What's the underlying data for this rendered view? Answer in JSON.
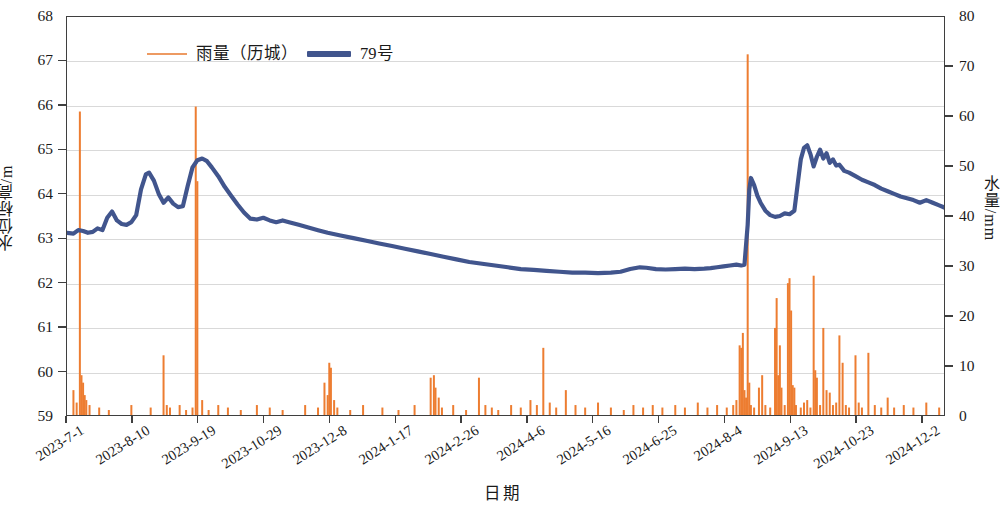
{
  "legend": {
    "position": "top-left",
    "items": [
      {
        "label": "雨量（历城）",
        "color": "#ed9a62",
        "style": "thin-line"
      },
      {
        "label": "79号",
        "color": "#41558d",
        "style": "thick-line"
      }
    ]
  },
  "axes": {
    "y_left_label": "水位标高/m",
    "y_right_label": "水量/mm",
    "x_label": "日期"
  },
  "chart_data": {
    "type": "line",
    "title": "",
    "xlabel": "日期",
    "ylabel": "水位标高/m",
    "y2label": "水量/mm",
    "ylim": [
      59,
      68
    ],
    "y2lim": [
      0,
      80
    ],
    "yticks": [
      59,
      60,
      61,
      62,
      63,
      64,
      65,
      66,
      67,
      68
    ],
    "y2ticks": [
      0,
      10,
      20,
      30,
      40,
      50,
      60,
      70,
      80
    ],
    "grid": "horizontal",
    "x_start": "2023-7-1",
    "x_end": "2024-12-27",
    "xtick_labels": [
      "2023-7-1",
      "2023-8-10",
      "2023-9-19",
      "2023-10-29",
      "2023-12-8",
      "2024-1-17",
      "2024-2-26",
      "2024-4-6",
      "2024-5-16",
      "2024-6-25",
      "2024-8-4",
      "2024-9-13",
      "2024-10-23",
      "2024-12-2"
    ],
    "xtick_interval_days": 40,
    "series": [
      {
        "name": "79号",
        "axis": "left",
        "type": "line",
        "color": "#41558d",
        "unit": "m",
        "points": [
          [
            0,
            63.12
          ],
          [
            4,
            63.1
          ],
          [
            7,
            63.18
          ],
          [
            10,
            63.16
          ],
          [
            13,
            63.12
          ],
          [
            16,
            63.14
          ],
          [
            19,
            63.22
          ],
          [
            22,
            63.18
          ],
          [
            25,
            63.46
          ],
          [
            28,
            63.6
          ],
          [
            31,
            63.4
          ],
          [
            34,
            63.32
          ],
          [
            37,
            63.3
          ],
          [
            40,
            63.36
          ],
          [
            43,
            63.52
          ],
          [
            46,
            64.1
          ],
          [
            49,
            64.44
          ],
          [
            51,
            64.48
          ],
          [
            54,
            64.3
          ],
          [
            57,
            64.0
          ],
          [
            60,
            63.8
          ],
          [
            63,
            63.92
          ],
          [
            66,
            63.78
          ],
          [
            69,
            63.7
          ],
          [
            72,
            63.72
          ],
          [
            75,
            64.18
          ],
          [
            78,
            64.6
          ],
          [
            81,
            64.76
          ],
          [
            84,
            64.8
          ],
          [
            87,
            64.74
          ],
          [
            90,
            64.6
          ],
          [
            94,
            64.4
          ],
          [
            98,
            64.16
          ],
          [
            102,
            63.96
          ],
          [
            106,
            63.76
          ],
          [
            110,
            63.58
          ],
          [
            114,
            63.44
          ],
          [
            118,
            63.42
          ],
          [
            122,
            63.46
          ],
          [
            126,
            63.4
          ],
          [
            130,
            63.36
          ],
          [
            134,
            63.4
          ],
          [
            138,
            63.36
          ],
          [
            144,
            63.3
          ],
          [
            150,
            63.24
          ],
          [
            156,
            63.18
          ],
          [
            162,
            63.12
          ],
          [
            170,
            63.06
          ],
          [
            178,
            63.0
          ],
          [
            186,
            62.94
          ],
          [
            194,
            62.88
          ],
          [
            202,
            62.82
          ],
          [
            210,
            62.76
          ],
          [
            218,
            62.7
          ],
          [
            226,
            62.64
          ],
          [
            234,
            62.58
          ],
          [
            242,
            62.52
          ],
          [
            250,
            62.46
          ],
          [
            258,
            62.42
          ],
          [
            266,
            62.38
          ],
          [
            274,
            62.34
          ],
          [
            282,
            62.3
          ],
          [
            290,
            62.28
          ],
          [
            298,
            62.26
          ],
          [
            306,
            62.24
          ],
          [
            314,
            62.22
          ],
          [
            322,
            62.22
          ],
          [
            330,
            62.21
          ],
          [
            338,
            62.22
          ],
          [
            344,
            62.24
          ],
          [
            350,
            62.3
          ],
          [
            356,
            62.34
          ],
          [
            360,
            62.33
          ],
          [
            366,
            62.3
          ],
          [
            372,
            62.29
          ],
          [
            378,
            62.3
          ],
          [
            384,
            62.31
          ],
          [
            390,
            62.3
          ],
          [
            396,
            62.31
          ],
          [
            400,
            62.32
          ],
          [
            404,
            62.34
          ],
          [
            408,
            62.36
          ],
          [
            412,
            62.38
          ],
          [
            416,
            62.4
          ],
          [
            419,
            62.38
          ],
          [
            421,
            62.4
          ],
          [
            423,
            63.3
          ],
          [
            424,
            64.1
          ],
          [
            425,
            64.36
          ],
          [
            427,
            64.2
          ],
          [
            429,
            63.96
          ],
          [
            431,
            63.8
          ],
          [
            434,
            63.62
          ],
          [
            437,
            63.52
          ],
          [
            440,
            63.48
          ],
          [
            443,
            63.5
          ],
          [
            446,
            63.56
          ],
          [
            449,
            63.54
          ],
          [
            452,
            63.62
          ],
          [
            454,
            64.2
          ],
          [
            456,
            64.78
          ],
          [
            458,
            65.04
          ],
          [
            460,
            65.1
          ],
          [
            462,
            64.9
          ],
          [
            464,
            64.62
          ],
          [
            466,
            64.84
          ],
          [
            468,
            65.0
          ],
          [
            470,
            64.8
          ],
          [
            472,
            64.92
          ],
          [
            474,
            64.7
          ],
          [
            476,
            64.78
          ],
          [
            478,
            64.64
          ],
          [
            480,
            64.66
          ],
          [
            483,
            64.52
          ],
          [
            486,
            64.48
          ],
          [
            490,
            64.4
          ],
          [
            494,
            64.32
          ],
          [
            498,
            64.26
          ],
          [
            502,
            64.2
          ],
          [
            506,
            64.12
          ],
          [
            510,
            64.06
          ],
          [
            514,
            64.0
          ],
          [
            518,
            63.94
          ],
          [
            522,
            63.9
          ],
          [
            526,
            63.86
          ],
          [
            530,
            63.8
          ],
          [
            534,
            63.86
          ],
          [
            538,
            63.8
          ],
          [
            542,
            63.74
          ],
          [
            546,
            63.68
          ],
          [
            550,
            63.62
          ],
          [
            556,
            63.56
          ],
          [
            562,
            63.5
          ],
          [
            568,
            63.46
          ],
          [
            574,
            63.42
          ],
          [
            580,
            63.4
          ],
          [
            586,
            63.38
          ],
          [
            592,
            63.42
          ],
          [
            596,
            63.5
          ],
          [
            600,
            63.46
          ],
          [
            606,
            63.4
          ],
          [
            612,
            63.36
          ],
          [
            618,
            63.32
          ],
          [
            624,
            63.3
          ],
          [
            630,
            63.32
          ],
          [
            636,
            63.3
          ],
          [
            642,
            63.28
          ],
          [
            648,
            63.26
          ],
          [
            654,
            63.22
          ],
          [
            660,
            63.18
          ],
          [
            666,
            63.14
          ],
          [
            672,
            63.1
          ],
          [
            678,
            63.06
          ],
          [
            680,
            63.04
          ]
        ]
      },
      {
        "name": "雨量（历城）",
        "axis": "right",
        "type": "bar",
        "color": "#ed7d31",
        "unit": "mm",
        "bars": [
          [
            4,
            5.0
          ],
          [
            6,
            2.5
          ],
          [
            8,
            61.0
          ],
          [
            9,
            8.0
          ],
          [
            10,
            6.5
          ],
          [
            11,
            4.0
          ],
          [
            12,
            3.0
          ],
          [
            14,
            2.0
          ],
          [
            20,
            1.5
          ],
          [
            26,
            1.0
          ],
          [
            40,
            2.0
          ],
          [
            52,
            1.5
          ],
          [
            60,
            12.0
          ],
          [
            62,
            2.0
          ],
          [
            64,
            1.5
          ],
          [
            70,
            2.0
          ],
          [
            74,
            1.0
          ],
          [
            78,
            1.5
          ],
          [
            80,
            62.0
          ],
          [
            81,
            47.0
          ],
          [
            84,
            3.0
          ],
          [
            88,
            1.0
          ],
          [
            94,
            2.0
          ],
          [
            100,
            1.5
          ],
          [
            108,
            1.0
          ],
          [
            118,
            2.0
          ],
          [
            126,
            1.5
          ],
          [
            134,
            1.0
          ],
          [
            148,
            2.0
          ],
          [
            156,
            1.5
          ],
          [
            160,
            6.5
          ],
          [
            162,
            4.0
          ],
          [
            163,
            10.5
          ],
          [
            164,
            9.5
          ],
          [
            166,
            3.0
          ],
          [
            168,
            1.5
          ],
          [
            176,
            1.0
          ],
          [
            184,
            2.0
          ],
          [
            196,
            1.5
          ],
          [
            206,
            1.0
          ],
          [
            216,
            2.0
          ],
          [
            226,
            7.5
          ],
          [
            228,
            8.0
          ],
          [
            229,
            5.5
          ],
          [
            231,
            3.5
          ],
          [
            233,
            1.5
          ],
          [
            240,
            2.0
          ],
          [
            248,
            1.0
          ],
          [
            256,
            7.5
          ],
          [
            260,
            2.0
          ],
          [
            264,
            1.5
          ],
          [
            268,
            1.0
          ],
          [
            276,
            2.0
          ],
          [
            282,
            1.5
          ],
          [
            288,
            3.0
          ],
          [
            292,
            2.0
          ],
          [
            296,
            13.5
          ],
          [
            300,
            2.5
          ],
          [
            304,
            1.5
          ],
          [
            310,
            5.0
          ],
          [
            316,
            2.0
          ],
          [
            322,
            1.5
          ],
          [
            330,
            2.5
          ],
          [
            338,
            1.5
          ],
          [
            346,
            1.0
          ],
          [
            352,
            2.0
          ],
          [
            358,
            1.5
          ],
          [
            364,
            2.0
          ],
          [
            370,
            1.5
          ],
          [
            378,
            2.0
          ],
          [
            384,
            1.5
          ],
          [
            392,
            2.5
          ],
          [
            398,
            1.5
          ],
          [
            404,
            2.0
          ],
          [
            410,
            1.5
          ],
          [
            414,
            2.0
          ],
          [
            416,
            3.0
          ],
          [
            418,
            14.0
          ],
          [
            419,
            13.5
          ],
          [
            420,
            16.5
          ],
          [
            421,
            5.0
          ],
          [
            422,
            3.5
          ],
          [
            423,
            72.5
          ],
          [
            424,
            6.5
          ],
          [
            425,
            2.0
          ],
          [
            427,
            1.5
          ],
          [
            430,
            5.5
          ],
          [
            432,
            8.0
          ],
          [
            434,
            2.0
          ],
          [
            437,
            1.5
          ],
          [
            440,
            17.5
          ],
          [
            441,
            23.5
          ],
          [
            442,
            8.0
          ],
          [
            443,
            14.0
          ],
          [
            444,
            5.5
          ],
          [
            446,
            2.0
          ],
          [
            448,
            26.5
          ],
          [
            449,
            27.5
          ],
          [
            450,
            21.0
          ],
          [
            451,
            6.0
          ],
          [
            452,
            5.5
          ],
          [
            453,
            2.0
          ],
          [
            456,
            1.5
          ],
          [
            458,
            2.5
          ],
          [
            460,
            3.0
          ],
          [
            462,
            1.5
          ],
          [
            464,
            28.0
          ],
          [
            465,
            9.0
          ],
          [
            466,
            7.5
          ],
          [
            468,
            2.0
          ],
          [
            470,
            17.5
          ],
          [
            472,
            5.0
          ],
          [
            474,
            4.5
          ],
          [
            476,
            2.0
          ],
          [
            478,
            2.5
          ],
          [
            480,
            16.0
          ],
          [
            482,
            10.5
          ],
          [
            484,
            2.0
          ],
          [
            486,
            1.5
          ],
          [
            490,
            12.0
          ],
          [
            492,
            2.5
          ],
          [
            494,
            1.5
          ],
          [
            498,
            12.5
          ],
          [
            502,
            2.0
          ],
          [
            506,
            1.5
          ],
          [
            510,
            3.5
          ],
          [
            514,
            1.5
          ],
          [
            520,
            2.0
          ],
          [
            526,
            1.5
          ],
          [
            534,
            2.5
          ],
          [
            542,
            1.5
          ],
          [
            550,
            2.0
          ],
          [
            558,
            1.5
          ],
          [
            566,
            2.5
          ],
          [
            574,
            1.5
          ],
          [
            582,
            2.0
          ],
          [
            588,
            25.5
          ],
          [
            592,
            2.0
          ],
          [
            598,
            1.5
          ],
          [
            606,
            2.0
          ],
          [
            614,
            1.5
          ],
          [
            622,
            2.5
          ],
          [
            630,
            1.5
          ],
          [
            640,
            1.5
          ],
          [
            646,
            18.5
          ],
          [
            652,
            2.0
          ],
          [
            660,
            1.5
          ],
          [
            668,
            2.0
          ],
          [
            676,
            1.5
          ]
        ]
      }
    ]
  }
}
